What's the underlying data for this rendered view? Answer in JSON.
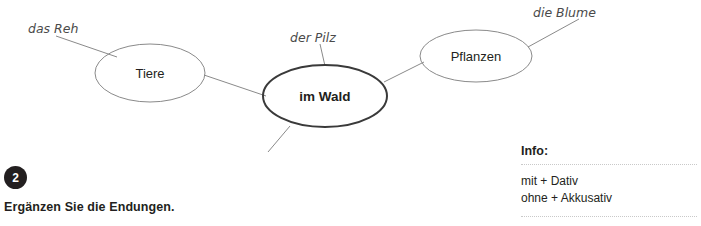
{
  "mindmap": {
    "center_node": {
      "label": "im Wald"
    },
    "branch_nodes": [
      {
        "label": "Tiere"
      },
      {
        "label": "Pflanzen"
      }
    ],
    "handwritten_labels": [
      {
        "text": "das Reh"
      },
      {
        "text": "der Pilz"
      },
      {
        "text": "die Blume"
      }
    ],
    "colors": {
      "center_stroke": "#3a3a3a",
      "branch_stroke": "#8a8a8a",
      "connector": "#8a8a8a",
      "hand_text": "#4a4a4a"
    }
  },
  "exercise": {
    "number": "2",
    "instruction": "Ergänzen Sie die Endungen."
  },
  "info": {
    "title": "Info:",
    "line1": "mit + Dativ",
    "line2": "ohne + Akkusativ"
  }
}
